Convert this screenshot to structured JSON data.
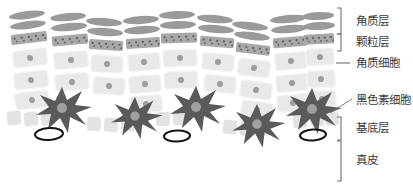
{
  "figure": {
    "background_color": "#ffffff"
  },
  "colors": {
    "corneum_cell": "#9a9a9a",
    "granular_cell": "#a8a8a8",
    "granule_dot": "#5d5d5d",
    "keratinocyte_fill": "#e9e9e9",
    "keratinocyte_stroke": "#f4f4f4",
    "keratinocyte_nucleus": "#9d9d9d",
    "basal_cell": "#e3e3e3",
    "melanocyte_body": "#5a5a5a",
    "melanocyte_nucleus": "#a0a0a0",
    "vessel_outline": "#151515",
    "label_text": "#3b3b3b",
    "bracket_line": "#6f6f6f",
    "leader_line": "#6f6f6f"
  },
  "labels": [
    {
      "id": "stratum-corneum",
      "text": "角质层",
      "marker": "bracket",
      "x": 356,
      "y": 21,
      "bracket": {
        "x": 341,
        "y1": 8,
        "y2": 34
      }
    },
    {
      "id": "granular-layer",
      "text": "颗粒层",
      "marker": "bracket",
      "x": 356,
      "y": 42,
      "bracket": {
        "x": 341,
        "y1": 34,
        "y2": 51
      }
    },
    {
      "id": "keratinocyte",
      "text": "角质细胞",
      "marker": "dash",
      "x": 356,
      "y": 63,
      "dash": {
        "x1": 336,
        "x2": 350,
        "y": 63
      }
    },
    {
      "id": "melanocyte",
      "text": "黑色素细胞",
      "marker": "leader",
      "x": 356,
      "y": 100,
      "leader": {
        "x1": 330,
        "y1": 113,
        "x2": 352,
        "y2": 99
      }
    },
    {
      "id": "basal-layer",
      "text": "基底层",
      "marker": "bracket",
      "x": 356,
      "y": 128,
      "bracket": {
        "x": 341,
        "y1": 117,
        "y2": 140
      }
    },
    {
      "id": "dermis",
      "text": "真皮",
      "marker": "bracket",
      "x": 356,
      "y": 160,
      "bracket": {
        "x": 341,
        "y1": 141,
        "y2": 181
      }
    }
  ],
  "layers": {
    "stratum_corneum": {
      "name": "角质层",
      "cell_shape": "flattened-ellipse",
      "rows": 2,
      "column_count": 9
    },
    "granular_layer": {
      "name": "颗粒层",
      "cell_shape": "rectangle-with-granules",
      "rows": 1,
      "column_count": 9,
      "granules_per_cell": 5
    },
    "keratinocyte_layers": {
      "name": "角质细胞",
      "cell_shape": "rounded-rectangle-with-nucleus",
      "rows": 3,
      "column_count": 9
    },
    "basal_layer": {
      "name": "基底层",
      "cell_shape": "small-rounded-square",
      "rows": 1,
      "column_count": 9
    },
    "dermis": {
      "name": "真皮",
      "content": "blood-vessel-outlines",
      "vessel_count": 3
    }
  },
  "cells": {
    "corneum": [
      {
        "cx": 27,
        "cy": 15,
        "rx": 18,
        "ry": 4.0,
        "rot": -7
      },
      {
        "cx": 28,
        "cy": 25,
        "rx": 18,
        "ry": 4.0,
        "rot": -7
      },
      {
        "cx": 68,
        "cy": 17,
        "rx": 18,
        "ry": 4.0,
        "rot": -5
      },
      {
        "cx": 69,
        "cy": 27,
        "rx": 18,
        "ry": 4.0,
        "rot": -5
      },
      {
        "cx": 104,
        "cy": 22,
        "rx": 18,
        "ry": 4.0,
        "rot": 4
      },
      {
        "cx": 105,
        "cy": 32,
        "rx": 18,
        "ry": 4.0,
        "rot": 4
      },
      {
        "cx": 141,
        "cy": 20,
        "rx": 18,
        "ry": 4.0,
        "rot": -4
      },
      {
        "cx": 142,
        "cy": 30,
        "rx": 18,
        "ry": 4.0,
        "rot": -4
      },
      {
        "cx": 177,
        "cy": 15,
        "rx": 18,
        "ry": 4.0,
        "rot": -2
      },
      {
        "cx": 178,
        "cy": 25,
        "rx": 18,
        "ry": 4.0,
        "rot": -2
      },
      {
        "cx": 215,
        "cy": 19,
        "rx": 18,
        "ry": 4.0,
        "rot": 5
      },
      {
        "cx": 216,
        "cy": 29,
        "rx": 18,
        "ry": 4.0,
        "rot": 5
      },
      {
        "cx": 250,
        "cy": 26,
        "rx": 18,
        "ry": 4.0,
        "rot": 7
      },
      {
        "cx": 252,
        "cy": 36,
        "rx": 18,
        "ry": 4.0,
        "rot": 7
      },
      {
        "cx": 288,
        "cy": 19,
        "rx": 18,
        "ry": 4.0,
        "rot": -5
      },
      {
        "cx": 289,
        "cy": 29,
        "rx": 18,
        "ry": 4.0,
        "rot": -5
      },
      {
        "cx": 318,
        "cy": 16,
        "rx": 16,
        "ry": 4.0,
        "rot": -3
      },
      {
        "cx": 319,
        "cy": 26,
        "rx": 16,
        "ry": 4.0,
        "rot": -3
      }
    ],
    "granular": [
      {
        "cx": 29,
        "cy": 38,
        "w": 36,
        "h": 10,
        "rot": -7
      },
      {
        "cx": 70,
        "cy": 40,
        "w": 36,
        "h": 10,
        "rot": -5
      },
      {
        "cx": 106,
        "cy": 45,
        "w": 34,
        "h": 10,
        "rot": 4
      },
      {
        "cx": 143,
        "cy": 43,
        "w": 34,
        "h": 10,
        "rot": -4
      },
      {
        "cx": 179,
        "cy": 38,
        "w": 36,
        "h": 10,
        "rot": -2
      },
      {
        "cx": 217,
        "cy": 42,
        "w": 34,
        "h": 10,
        "rot": 5
      },
      {
        "cx": 253,
        "cy": 49,
        "w": 34,
        "h": 10,
        "rot": 7
      },
      {
        "cx": 290,
        "cy": 42,
        "w": 34,
        "h": 10,
        "rot": -5
      },
      {
        "cx": 319,
        "cy": 39,
        "w": 30,
        "h": 10,
        "rot": -3
      }
    ],
    "keratinocytes": [
      {
        "cx": 30,
        "cy": 58,
        "w": 34,
        "h": 17,
        "rot": -7
      },
      {
        "cx": 31,
        "cy": 80,
        "w": 34,
        "h": 17,
        "rot": -7
      },
      {
        "cx": 32,
        "cy": 100,
        "w": 34,
        "h": 17,
        "rot": -7
      },
      {
        "cx": 71,
        "cy": 60,
        "w": 34,
        "h": 17,
        "rot": -5
      },
      {
        "cx": 72,
        "cy": 82,
        "w": 34,
        "h": 17,
        "rot": -5
      },
      {
        "cx": 107,
        "cy": 64,
        "w": 32,
        "h": 17,
        "rot": 4
      },
      {
        "cx": 109,
        "cy": 86,
        "w": 32,
        "h": 17,
        "rot": 4
      },
      {
        "cx": 144,
        "cy": 62,
        "w": 32,
        "h": 17,
        "rot": -4
      },
      {
        "cx": 145,
        "cy": 84,
        "w": 32,
        "h": 17,
        "rot": -4
      },
      {
        "cx": 146,
        "cy": 104,
        "w": 32,
        "h": 17,
        "rot": -4
      },
      {
        "cx": 180,
        "cy": 58,
        "w": 34,
        "h": 17,
        "rot": -2
      },
      {
        "cx": 181,
        "cy": 80,
        "w": 34,
        "h": 17,
        "rot": -2
      },
      {
        "cx": 218,
        "cy": 62,
        "w": 32,
        "h": 17,
        "rot": 5
      },
      {
        "cx": 220,
        "cy": 84,
        "w": 32,
        "h": 17,
        "rot": 5
      },
      {
        "cx": 254,
        "cy": 68,
        "w": 32,
        "h": 17,
        "rot": 7
      },
      {
        "cx": 256,
        "cy": 90,
        "w": 32,
        "h": 17,
        "rot": 7
      },
      {
        "cx": 257,
        "cy": 110,
        "w": 32,
        "h": 17,
        "rot": 7
      },
      {
        "cx": 291,
        "cy": 61,
        "w": 32,
        "h": 17,
        "rot": -5
      },
      {
        "cx": 292,
        "cy": 83,
        "w": 32,
        "h": 17,
        "rot": -5
      },
      {
        "cx": 293,
        "cy": 103,
        "w": 32,
        "h": 17,
        "rot": -5
      },
      {
        "cx": 320,
        "cy": 57,
        "w": 28,
        "h": 17,
        "rot": -3
      },
      {
        "cx": 321,
        "cy": 79,
        "w": 28,
        "h": 17,
        "rot": -3
      },
      {
        "cx": 322,
        "cy": 99,
        "w": 28,
        "h": 17,
        "rot": -3
      }
    ],
    "basal": [
      {
        "cx": 14,
        "cy": 118,
        "s": 14,
        "rot": -6
      },
      {
        "cx": 31,
        "cy": 119,
        "s": 14,
        "rot": -6
      },
      {
        "cx": 48,
        "cy": 118,
        "s": 14,
        "rot": -6
      },
      {
        "cx": 94,
        "cy": 124,
        "s": 14,
        "rot": 3
      },
      {
        "cx": 111,
        "cy": 125,
        "s": 14,
        "rot": 3
      },
      {
        "cx": 128,
        "cy": 124,
        "s": 14,
        "rot": 3
      },
      {
        "cx": 163,
        "cy": 119,
        "s": 14,
        "rot": -2
      },
      {
        "cx": 180,
        "cy": 118,
        "s": 14,
        "rot": -2
      },
      {
        "cx": 230,
        "cy": 127,
        "s": 14,
        "rot": 6
      },
      {
        "cx": 247,
        "cy": 129,
        "s": 14,
        "rot": 6
      },
      {
        "cx": 264,
        "cy": 128,
        "s": 14,
        "rot": 6
      },
      {
        "cx": 300,
        "cy": 121,
        "s": 14,
        "rot": -4
      },
      {
        "cx": 317,
        "cy": 119,
        "s": 14,
        "rot": -4
      },
      {
        "cx": 332,
        "cy": 118,
        "s": 14,
        "rot": -4
      }
    ],
    "melanocytes": [
      {
        "cx": 62,
        "cy": 109,
        "scale": 1.0
      },
      {
        "cx": 135,
        "cy": 117,
        "scale": 0.92
      },
      {
        "cx": 196,
        "cy": 108,
        "scale": 1.0
      },
      {
        "cx": 257,
        "cy": 125,
        "scale": 0.95
      },
      {
        "cx": 312,
        "cy": 110,
        "scale": 1.0
      }
    ],
    "vessels": [
      {
        "cx": 49,
        "cy": 134,
        "rx": 14,
        "ry": 6,
        "rot": -3
      },
      {
        "cx": 177,
        "cy": 136,
        "rx": 13,
        "ry": 5.5,
        "rot": -2
      },
      {
        "cx": 313,
        "cy": 135,
        "rx": 13,
        "ry": 5.5,
        "rot": -4
      }
    ]
  }
}
